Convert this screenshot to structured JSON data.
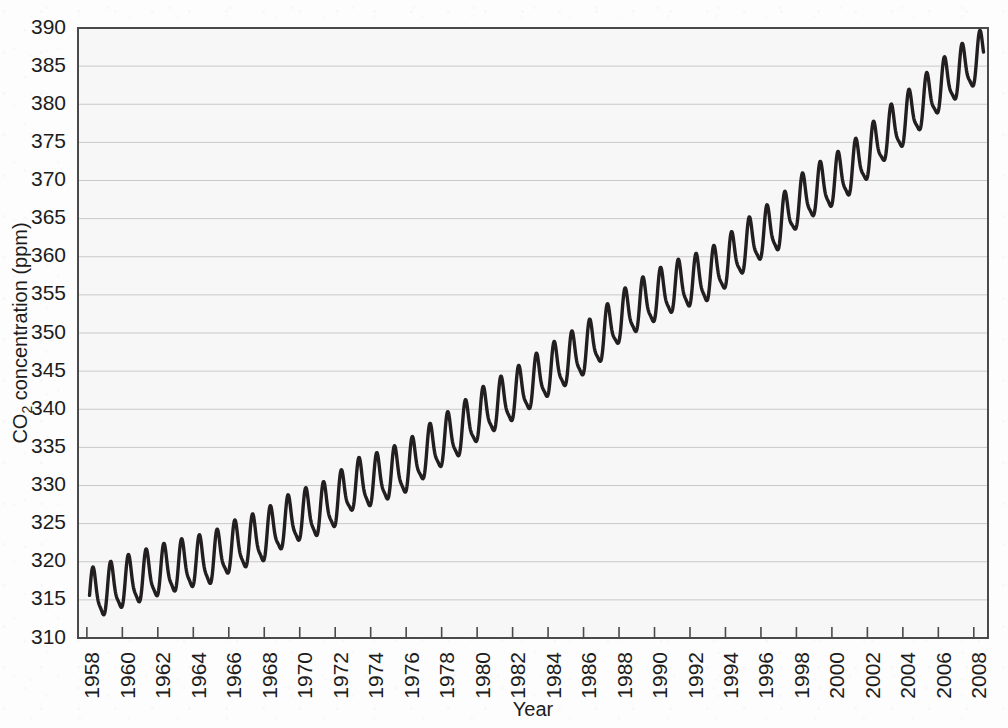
{
  "chart_data": {
    "type": "line",
    "title": "",
    "xlabel": "Year",
    "ylabel_prefix": "CO",
    "ylabel_sub": "2",
    "ylabel_suffix": " concentration (ppm)",
    "ylabel_full": "CO2 concentration (ppm)",
    "xlim": [
      1957.5,
      2008.8
    ],
    "ylim": [
      310,
      390
    ],
    "grid": true,
    "legend": null,
    "series_name": "Atmospheric CO2 concentration (Mauna Loa monthly mean)",
    "x_ticks": [
      1958,
      1960,
      1962,
      1964,
      1966,
      1968,
      1970,
      1972,
      1974,
      1976,
      1978,
      1980,
      1982,
      1984,
      1986,
      1988,
      1990,
      1992,
      1994,
      1996,
      1998,
      2000,
      2002,
      2004,
      2006,
      2008
    ],
    "x_tick_labels": [
      "1958",
      "1960",
      "1962",
      "1964",
      "1966",
      "1968",
      "1970",
      "1972",
      "1974",
      "1976",
      "1978",
      "1980",
      "1982",
      "1984",
      "1986",
      "1988",
      "1990",
      "1992",
      "1994",
      "1996",
      "1998",
      "2000",
      "2002",
      "2004",
      "2006",
      "2008"
    ],
    "y_ticks": [
      310,
      315,
      320,
      325,
      330,
      335,
      340,
      345,
      350,
      355,
      360,
      365,
      370,
      375,
      380,
      385,
      390
    ],
    "y_tick_labels": [
      "310",
      "315",
      "320",
      "325",
      "330",
      "335",
      "340",
      "345",
      "350",
      "355",
      "360",
      "365",
      "370",
      "375",
      "380",
      "385",
      "390"
    ],
    "seasonal_amplitude_ppm": 3.1,
    "seasonal_peak_month": "May",
    "seasonal_trough_month": "October",
    "annual_mean_x": [
      1958,
      1959,
      1960,
      1961,
      1962,
      1963,
      1964,
      1965,
      1966,
      1967,
      1968,
      1969,
      1970,
      1971,
      1972,
      1973,
      1974,
      1975,
      1976,
      1977,
      1978,
      1979,
      1980,
      1981,
      1982,
      1983,
      1984,
      1985,
      1986,
      1987,
      1988,
      1989,
      1990,
      1991,
      1992,
      1993,
      1994,
      1995,
      1996,
      1997,
      1998,
      1999,
      2000,
      2001,
      2002,
      2003,
      2004,
      2005,
      2006,
      2007,
      2008
    ],
    "annual_mean_y": [
      315.3,
      315.9,
      316.9,
      317.6,
      318.4,
      319.0,
      319.6,
      320.0,
      321.4,
      322.2,
      323.0,
      324.6,
      325.7,
      326.3,
      327.5,
      329.7,
      330.2,
      331.1,
      332.0,
      333.8,
      335.4,
      336.8,
      338.7,
      340.1,
      341.4,
      343.0,
      344.6,
      346.0,
      347.4,
      349.2,
      351.6,
      353.1,
      354.4,
      355.6,
      356.4,
      357.1,
      358.8,
      360.8,
      362.6,
      363.8,
      366.6,
      368.3,
      369.5,
      371.0,
      373.1,
      375.6,
      377.4,
      379.6,
      381.8,
      383.6,
      385.3
    ]
  },
  "geometry": {
    "plot_left": 78,
    "plot_right": 988,
    "plot_top": 28,
    "plot_bottom": 638
  }
}
